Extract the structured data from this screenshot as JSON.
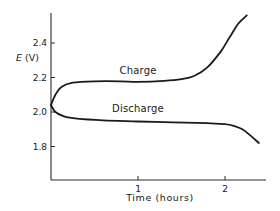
{
  "chart_data": {
    "type": "line",
    "title": "",
    "xlabel": "Time (hours)",
    "ylabel": "E (V)",
    "ylabel_italic_part": "E",
    "ylabel_unit_part": "(V)",
    "xlim": [
      0,
      2.45
    ],
    "ylim": [
      1.62,
      2.58
    ],
    "x_ticks": [
      1,
      2
    ],
    "x_tick_labels": [
      "1",
      "2"
    ],
    "y_ticks": [
      1.8,
      2.0,
      2.2,
      2.4
    ],
    "y_tick_labels": [
      "1.8",
      "2.0",
      "2.2",
      "2.4"
    ],
    "grid": false,
    "legend": "inline labels",
    "series": [
      {
        "name": "Charge",
        "label_position": {
          "t": 1.0,
          "v": 2.22
        },
        "points": [
          [
            0.0,
            2.04
          ],
          [
            0.05,
            2.1
          ],
          [
            0.12,
            2.145
          ],
          [
            0.25,
            2.17
          ],
          [
            0.5,
            2.178
          ],
          [
            0.8,
            2.178
          ],
          [
            1.0,
            2.175
          ],
          [
            1.3,
            2.18
          ],
          [
            1.5,
            2.19
          ],
          [
            1.65,
            2.21
          ],
          [
            1.8,
            2.26
          ],
          [
            1.95,
            2.35
          ],
          [
            2.05,
            2.43
          ],
          [
            2.15,
            2.51
          ],
          [
            2.25,
            2.56
          ]
        ]
      },
      {
        "name": "Discharge",
        "label_position": {
          "t": 1.0,
          "v": 2.0
        },
        "points": [
          [
            0.0,
            2.04
          ],
          [
            0.05,
            2.0
          ],
          [
            0.15,
            1.975
          ],
          [
            0.3,
            1.962
          ],
          [
            0.6,
            1.952
          ],
          [
            1.0,
            1.945
          ],
          [
            1.4,
            1.94
          ],
          [
            1.8,
            1.935
          ],
          [
            2.0,
            1.93
          ],
          [
            2.1,
            1.92
          ],
          [
            2.2,
            1.9
          ],
          [
            2.3,
            1.86
          ],
          [
            2.39,
            1.82
          ]
        ]
      }
    ]
  },
  "colors": {
    "line": "#1a1a1a",
    "axis": "#2b2b2b",
    "background": "#ffffff"
  }
}
